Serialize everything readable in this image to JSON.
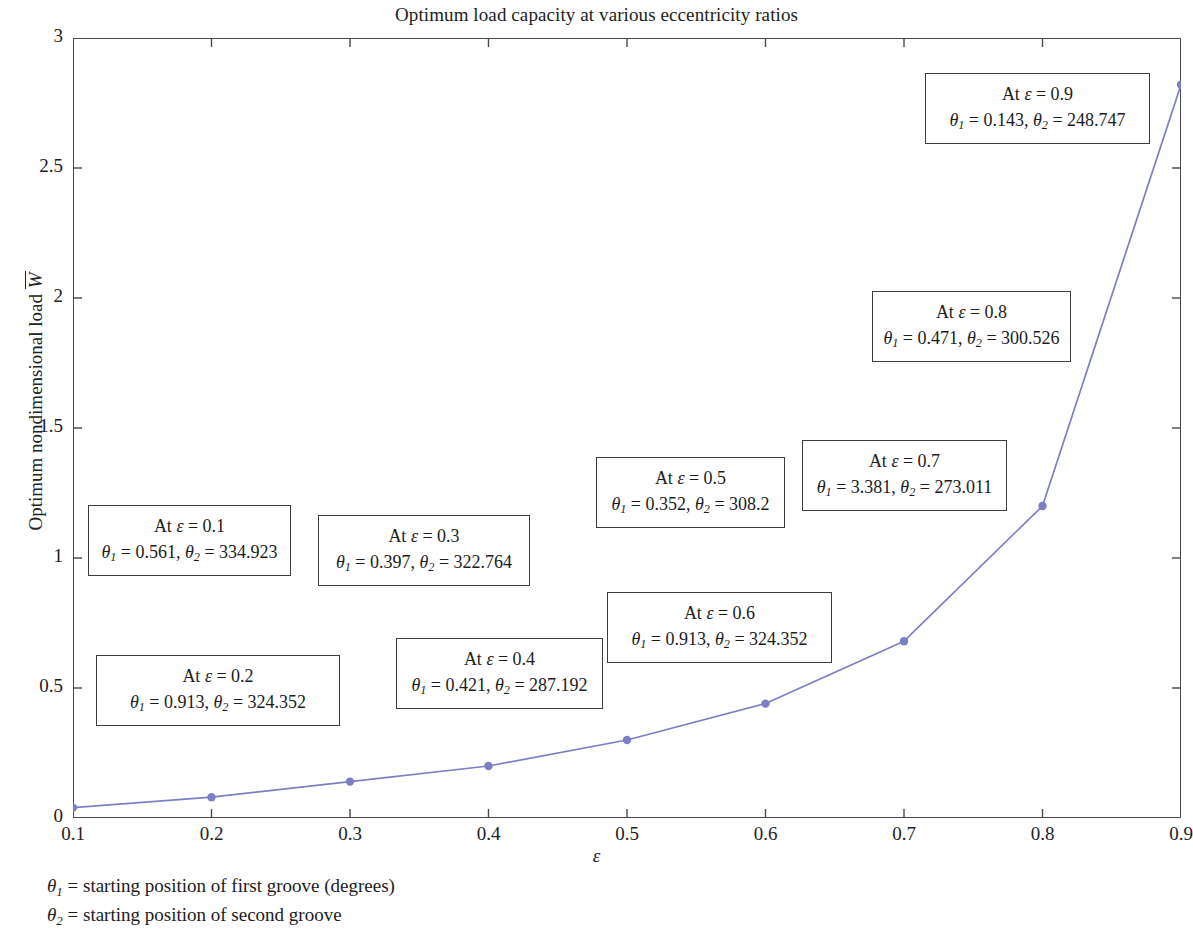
{
  "chart_data": {
    "type": "line",
    "title": "Optimum load capacity at various eccentricity ratios",
    "xlabel": "ε",
    "ylabel": "Optimum nondimensional load W̅",
    "x": [
      0.1,
      0.2,
      0.3,
      0.4,
      0.5,
      0.6,
      0.7,
      0.8,
      0.9
    ],
    "values": [
      0.04,
      0.08,
      0.14,
      0.2,
      0.3,
      0.44,
      0.68,
      1.2,
      2.82
    ],
    "xlim": [
      0.1,
      0.9
    ],
    "ylim": [
      0,
      3
    ],
    "xticks": [
      "0.1",
      "0.2",
      "0.3",
      "0.4",
      "0.5",
      "0.6",
      "0.7",
      "0.8",
      "0.9"
    ],
    "yticks": [
      "0",
      "0.5",
      "1",
      "1.5",
      "2",
      "2.5",
      "3"
    ],
    "grid": false,
    "legend": "none",
    "series_color": "#7b7fc4",
    "marker": "circle"
  },
  "chart": {
    "title": "Optimum load capacity at various eccentricity ratios",
    "x_axis_label": "ε",
    "y_axis_label_prefix": "Optimum nondimensional load",
    "y_axis_label_symbol": "W",
    "x_ticks": [
      "0.1",
      "0.2",
      "0.3",
      "0.4",
      "0.5",
      "0.6",
      "0.7",
      "0.8",
      "0.9"
    ],
    "y_ticks": [
      "0",
      "0.5",
      "1",
      "1.5",
      "2",
      "2.5",
      "3"
    ]
  },
  "annotations": [
    {
      "id": "eps-0-1",
      "eps_label": "At ε = 0.1",
      "theta1": "0.561",
      "theta2": "334.923",
      "line2_prefix": "θ",
      "eps": 0.1
    },
    {
      "id": "eps-0-2",
      "eps_label": "At ε = 0.2",
      "theta1": "0.913",
      "theta2": "324.352",
      "eps": 0.2
    },
    {
      "id": "eps-0-3",
      "eps_label": "At ε = 0.3",
      "theta1": "0.397",
      "theta2": "322.764",
      "eps": 0.3
    },
    {
      "id": "eps-0-4",
      "eps_label": "At ε = 0.4",
      "theta1": "0.421",
      "theta2": "287.192",
      "eps": 0.4
    },
    {
      "id": "eps-0-5",
      "eps_label": "At ε = 0.5",
      "theta1": "0.352",
      "theta2": "308.2",
      "eps": 0.5
    },
    {
      "id": "eps-0-6",
      "eps_label": "At ε = 0.6",
      "theta1": "0.913",
      "theta2": "324.352",
      "eps": 0.6
    },
    {
      "id": "eps-0-7",
      "eps_label": "At ε = 0.7",
      "theta1": "3.381",
      "theta2": "273.011",
      "eps": 0.7
    },
    {
      "id": "eps-0-8",
      "eps_label": "At ε = 0.8",
      "theta1": "0.471",
      "theta2": "300.526",
      "eps": 0.8
    },
    {
      "id": "eps-0-9",
      "eps_label": "At ε = 0.9",
      "theta1": "0.143",
      "theta2": "248.747",
      "eps": 0.9
    }
  ],
  "footnotes": [
    "= starting position of first groove (degrees)",
    "= starting position of second groove"
  ]
}
